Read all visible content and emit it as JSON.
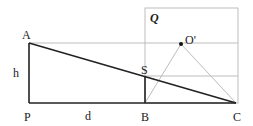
{
  "diagram": {
    "labels": {
      "A": "A",
      "P": "P",
      "B": "B",
      "C": "C",
      "S": "S",
      "O_prime": "O'",
      "h": "h",
      "d": "d",
      "Q": "Q"
    },
    "colors": {
      "dark_line": "#222222",
      "light_line": "#bdbdbd",
      "background": "#ffffff"
    }
  }
}
